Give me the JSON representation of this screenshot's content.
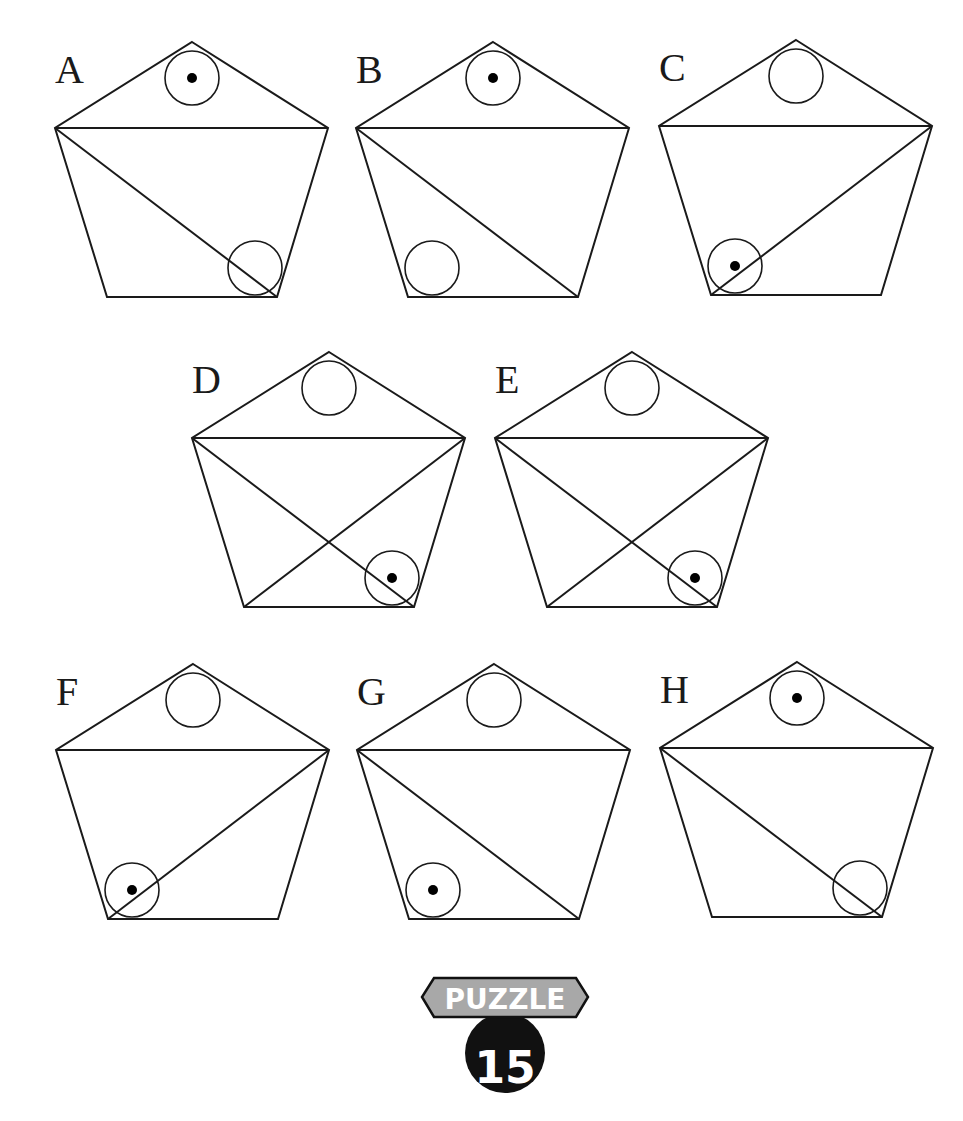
{
  "puzzle": {
    "badge_label": "PUZZLE",
    "badge_number": "15",
    "colors": {
      "stroke": "#1a1a1a",
      "dot": "#000000",
      "badge_gray": "#a8a8a8",
      "badge_dark": "#111111",
      "badge_text": "#ffffff"
    }
  },
  "figures": [
    {
      "id": "A",
      "label": "A",
      "x": 55,
      "y": 42,
      "diagonals": [
        "TL-BR"
      ],
      "top_circle_dot": true,
      "bottom_circle": "right",
      "bottom_circle_dot": false
    },
    {
      "id": "B",
      "label": "B",
      "x": 356,
      "y": 42,
      "diagonals": [
        "TL-BR"
      ],
      "top_circle_dot": true,
      "bottom_circle": "left",
      "bottom_circle_dot": false
    },
    {
      "id": "C",
      "label": "C",
      "x": 659,
      "y": 40,
      "diagonals": [
        "TR-BL"
      ],
      "top_circle_dot": false,
      "bottom_circle": "left",
      "bottom_circle_dot": true
    },
    {
      "id": "D",
      "label": "D",
      "x": 192,
      "y": 352,
      "diagonals": [
        "TL-BR",
        "TR-BL"
      ],
      "top_circle_dot": false,
      "bottom_circle": "right",
      "bottom_circle_dot": true
    },
    {
      "id": "E",
      "label": "E",
      "x": 495,
      "y": 352,
      "diagonals": [
        "TL-BR",
        "TR-BL"
      ],
      "top_circle_dot": false,
      "bottom_circle": "right",
      "bottom_circle_dot": true
    },
    {
      "id": "F",
      "label": "F",
      "x": 56,
      "y": 664,
      "diagonals": [
        "TR-BL"
      ],
      "top_circle_dot": false,
      "bottom_circle": "left",
      "bottom_circle_dot": true
    },
    {
      "id": "G",
      "label": "G",
      "x": 357,
      "y": 664,
      "diagonals": [
        "TL-BR"
      ],
      "top_circle_dot": false,
      "bottom_circle": "left",
      "bottom_circle_dot": true
    },
    {
      "id": "H",
      "label": "H",
      "x": 660,
      "y": 662,
      "diagonals": [
        "TL-BR"
      ],
      "top_circle_dot": true,
      "bottom_circle": "right",
      "bottom_circle_dot": false
    }
  ]
}
